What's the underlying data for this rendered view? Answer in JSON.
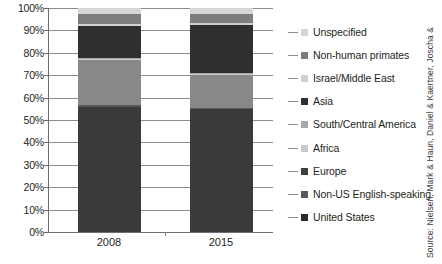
{
  "chart_data": {
    "type": "bar",
    "subtype": "stacked-100-percent",
    "title": "",
    "xlabel": "",
    "ylabel": "",
    "categories": [
      "2008",
      "2015"
    ],
    "ylim": [
      0,
      100
    ],
    "ytick_labels": [
      "100%",
      "90%",
      "80%",
      "70%",
      "60%",
      "50%",
      "40%",
      "30%",
      "20%",
      "10%",
      "0%"
    ],
    "ytick_values": [
      100,
      90,
      80,
      70,
      60,
      50,
      40,
      30,
      20,
      10,
      0
    ],
    "grid": true,
    "legend_position": "right",
    "stack_order_bottom_to_top": [
      "United States",
      "Non-US English-speaking",
      "Europe",
      "Africa",
      "South/Central America",
      "Asia",
      "Israel/Middle East",
      "Non-human primates",
      "Unspecified"
    ],
    "series": [
      {
        "name": "United States",
        "color": "#3a3a3a",
        "values": [
          56.0,
          55.0
        ]
      },
      {
        "name": "Non-US English-speaking",
        "color": "#595959",
        "values": [
          0.5,
          0.5
        ]
      },
      {
        "name": "Europe",
        "color": "#888888",
        "values": [
          20.5,
          14.5
        ]
      },
      {
        "name": "Africa",
        "color": "#c9c9c9",
        "values": [
          0.4,
          0.4
        ]
      },
      {
        "name": "South/Central America",
        "color": "#a8a8a8",
        "values": [
          0.4,
          0.4
        ]
      },
      {
        "name": "Asia",
        "color": "#2f2f2f",
        "values": [
          14.2,
          21.7
        ]
      },
      {
        "name": "Israel/Middle East",
        "color": "#cfcfcf",
        "values": [
          1.0,
          1.0
        ]
      },
      {
        "name": "Non-human primates",
        "color": "#7d7d7d",
        "values": [
          4.5,
          4.0
        ]
      },
      {
        "name": "Unspecified",
        "color": "#d6d6d6",
        "values": [
          2.5,
          2.5
        ]
      }
    ]
  },
  "axis": {
    "y_ticks": [
      {
        "label": "100%",
        "value": 100
      },
      {
        "label": "90%",
        "value": 90
      },
      {
        "label": "80%",
        "value": 80
      },
      {
        "label": "70%",
        "value": 70
      },
      {
        "label": "60%",
        "value": 60
      },
      {
        "label": "50%",
        "value": 50
      },
      {
        "label": "40%",
        "value": 40
      },
      {
        "label": "30%",
        "value": 30
      },
      {
        "label": "20%",
        "value": 20
      },
      {
        "label": "10%",
        "value": 10
      },
      {
        "label": "0%",
        "value": 0
      }
    ],
    "x_categories": [
      "2008",
      "2015"
    ]
  },
  "legend": {
    "items": [
      {
        "label": "Unspecified",
        "color": "#d6d6d6"
      },
      {
        "label": "Non-human primates",
        "color": "#7d7d7d"
      },
      {
        "label": "Israel/Middle East",
        "color": "#cfcfcf"
      },
      {
        "label": "Asia",
        "color": "#2f2f2f"
      },
      {
        "label": "South/Central America",
        "color": "#a8a8a8"
      },
      {
        "label": "Africa",
        "color": "#c9c9c9"
      },
      {
        "label": "Europe",
        "color": "#3f3f3f"
      },
      {
        "label": "Non-US English-speaking",
        "color": "#595959"
      },
      {
        "label": "United States",
        "color": "#2b2b2b"
      }
    ]
  },
  "source": {
    "text": "Source: Nielsen, Mark & Haun, Daniel & Kaertner, Joscha &"
  }
}
